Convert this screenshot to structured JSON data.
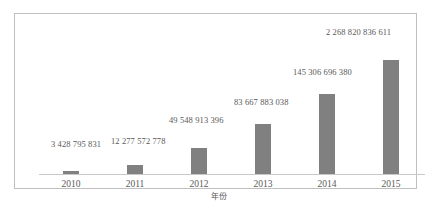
{
  "chart_data": {
    "type": "bar",
    "title": "",
    "subtitle": "",
    "xlabel": "年份",
    "ylabel": "",
    "categories": [
      "2010",
      "2011",
      "2012",
      "2013",
      "2014",
      "2015"
    ],
    "values": [
      3428795831,
      12277572778,
      49548913396,
      83667883038,
      145306696380,
      2268820836611
    ],
    "value_labels": [
      "3 428 795 831",
      "12 277 572 778",
      "49 548 913 396",
      "83 667 883 038",
      "145 306 696 380",
      "2 268 820 836 611"
    ],
    "bar_pixel_heights": [
      3,
      9,
      26,
      50,
      80,
      114
    ],
    "bar_color": "#808080",
    "axis_color": "#c8c8c8",
    "text_color": "#595959",
    "grid": false,
    "legend": false,
    "legend_position": "none",
    "ylim": [
      0,
      2268820836611
    ],
    "yticks": [],
    "note": "bar heights are not linearly proportional to values"
  },
  "figure": {
    "border_color": "#bfbfbf",
    "background": "#ffffff"
  }
}
